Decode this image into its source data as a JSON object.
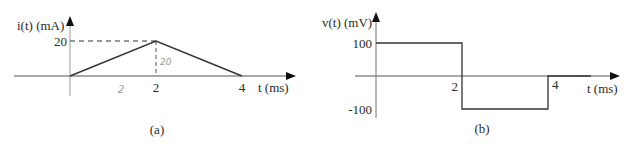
{
  "chart_data": [
    {
      "id": "a",
      "type": "line",
      "caption": "(a)",
      "ylabel": "i(t) (mA)",
      "xlabel": "t (ms)",
      "x_ticks": [
        "2",
        "4"
      ],
      "y_ticks": [
        "20"
      ],
      "xlim": [
        -2.6,
        5.1
      ],
      "ylim": [
        0,
        20
      ],
      "series": [
        {
          "name": "i(t)",
          "x": [
            -2.4,
            0,
            2,
            4,
            4.6
          ],
          "y": [
            0,
            0,
            20,
            0,
            0
          ]
        }
      ],
      "reference_lines": [
        {
          "kind": "horizontal-dashed",
          "y": 20,
          "from_x": 0,
          "to_x": 2
        },
        {
          "kind": "vertical-dashed",
          "x": 2,
          "from_y": 0,
          "to_y": 20
        }
      ],
      "annotations": [
        {
          "text": "2",
          "x": 1.1,
          "y": -3.5,
          "style": "handwritten"
        },
        {
          "text": "20",
          "x": 2.2,
          "y": 8,
          "style": "handwritten"
        }
      ]
    },
    {
      "id": "b",
      "type": "line",
      "caption": "(b)",
      "ylabel": "v(t) (mV)",
      "xlabel": "t (ms)",
      "x_ticks": [
        "2",
        "4"
      ],
      "y_ticks": [
        "100",
        "-100"
      ],
      "xlim": [
        -0.5,
        5.7
      ],
      "ylim": [
        -100,
        100
      ],
      "series": [
        {
          "name": "v(t)",
          "x": [
            0,
            2,
            2,
            4,
            4,
            5
          ],
          "y": [
            100,
            100,
            -100,
            -100,
            0,
            0
          ]
        }
      ]
    }
  ]
}
